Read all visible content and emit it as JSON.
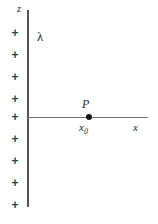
{
  "figure": {
    "background_color": "#ffffff",
    "line_color": "#555558",
    "axis_color": "#76767a",
    "charge_color": "#3a3a3e",
    "dot_color": "#15151a"
  },
  "axes": {
    "vertical_label": "z",
    "horizontal_label": "x"
  },
  "charge_distribution": {
    "symbol": "λ",
    "charge_glyph": "+",
    "charge_count": 9,
    "charges": [
      "+",
      "+",
      "+",
      "+",
      "+",
      "+",
      "+",
      "+",
      "+"
    ]
  },
  "field_point": {
    "label": "P",
    "coordinate_base": "x",
    "coordinate_subscript": "0"
  }
}
